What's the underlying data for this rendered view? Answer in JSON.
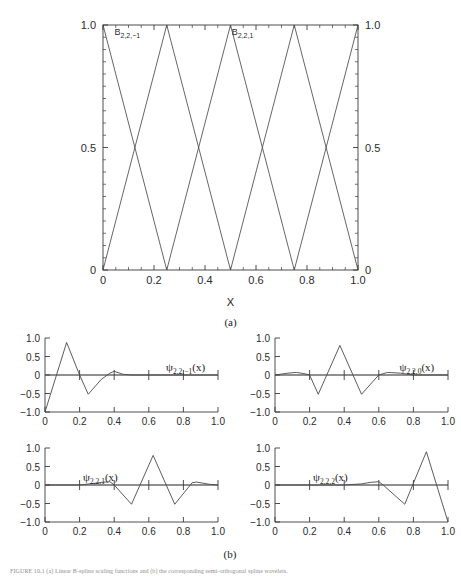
{
  "figure": {
    "panel_a_label": "(a)",
    "panel_b_label": "(b)",
    "caption": "FIGURE 10.1   (a) Linear B-spline scaling functions and (b) the corresponding semi-orthogonal spline wavelets."
  },
  "chart_data": [
    {
      "id": "panel-a",
      "type": "line",
      "title": "",
      "xlabel": "X",
      "ylabel": "",
      "xlim": [
        0,
        1
      ],
      "ylim": [
        0,
        1
      ],
      "grid": false,
      "xticks": [
        0,
        0.2,
        0.4,
        0.6,
        0.8,
        1.0
      ],
      "xticklabels": [
        "0",
        "0.2",
        "0.4",
        "0.6",
        "0.8",
        "1.0"
      ],
      "yticks": [
        0,
        0.5,
        1.0
      ],
      "yticklabels": [
        "0",
        "0.5",
        "1.0"
      ],
      "right_yticklabels": [
        "0",
        "0.5",
        "1.0"
      ],
      "annotations": [
        {
          "text": "B",
          "sub": "2,2,−1",
          "x": 0.045,
          "y": 0.975
        },
        {
          "text": "B",
          "sub": "2,2,1",
          "x": 0.505,
          "y": 0.975
        }
      ],
      "series": [
        {
          "name": "B_2,2,-1",
          "x": [
            0,
            0.25
          ],
          "values": [
            1,
            0
          ]
        },
        {
          "name": "B_2,2,0",
          "x": [
            0,
            0.25,
            0.5
          ],
          "values": [
            0,
            1,
            0
          ]
        },
        {
          "name": "B_2,2,1",
          "x": [
            0.25,
            0.5,
            0.75
          ],
          "values": [
            0,
            1,
            0
          ]
        },
        {
          "name": "B_2,2,2",
          "x": [
            0.5,
            0.75,
            1.0
          ],
          "values": [
            0,
            1,
            0
          ]
        },
        {
          "name": "B_2,2,3",
          "x": [
            0.75,
            1.0
          ],
          "values": [
            0,
            1
          ]
        }
      ]
    },
    {
      "id": "panel-b-1",
      "type": "line",
      "title": "ψ",
      "label_sub": "2,2,−1",
      "label_tail": "(x)",
      "xlim": [
        0,
        1
      ],
      "ylim": [
        -1,
        1
      ],
      "grid": false,
      "xticks": [
        0,
        0.2,
        0.4,
        0.6,
        0.8,
        1.0
      ],
      "xticklabels": [
        "0",
        "0.2",
        "0.4",
        "0.6",
        "0.8",
        "1.0"
      ],
      "yticks": [
        -1.0,
        -0.5,
        0,
        0.5,
        1.0
      ],
      "yticklabels": [
        "−1.0",
        "−0.5",
        "0",
        "0.5",
        "1.0"
      ],
      "x": [
        0,
        0.125,
        0.2,
        0.25,
        0.325,
        0.375,
        0.4,
        0.45,
        0.5,
        0.6,
        0.8,
        1.0
      ],
      "values": [
        -1.0,
        0.88,
        0.0,
        -0.52,
        -0.12,
        0.05,
        0.1,
        0.02,
        0.0,
        0.0,
        0.0,
        0.0
      ]
    },
    {
      "id": "panel-b-2",
      "type": "line",
      "title": "ψ",
      "label_sub": "2,2,0",
      "label_tail": "(x)",
      "xlim": [
        0,
        1
      ],
      "ylim": [
        -1,
        1
      ],
      "grid": false,
      "xticks": [
        0,
        0.2,
        0.4,
        0.6,
        0.8,
        1.0
      ],
      "xticklabels": [
        "0",
        "0.2",
        "0.4",
        "0.6",
        "0.8",
        "1.0"
      ],
      "yticks": [
        -1.0,
        -0.5,
        0,
        0.5,
        1.0
      ],
      "yticklabels": [
        "−1.0",
        "−0.5",
        "0",
        "0.5",
        "1.0"
      ],
      "x": [
        0,
        0.075,
        0.125,
        0.175,
        0.2,
        0.25,
        0.375,
        0.5,
        0.6,
        0.65,
        0.725,
        0.8,
        1.0
      ],
      "values": [
        0.0,
        0.05,
        0.07,
        0.03,
        0.0,
        -0.52,
        0.8,
        -0.52,
        0.0,
        0.07,
        0.05,
        0.0,
        0.0
      ]
    },
    {
      "id": "panel-b-3",
      "type": "line",
      "title": "ψ",
      "label_sub": "2,2,1",
      "label_tail": "(x)",
      "xlim": [
        0,
        1
      ],
      "ylim": [
        -1,
        1
      ],
      "grid": false,
      "xticks": [
        0,
        0.2,
        0.4,
        0.6,
        0.8,
        1.0
      ],
      "xticklabels": [
        "0",
        "0.2",
        "0.4",
        "0.6",
        "0.8",
        "1.0"
      ],
      "yticks": [
        -1.0,
        -0.5,
        0,
        0.5,
        1.0
      ],
      "yticklabels": [
        "−1.0",
        "−0.5",
        "0",
        "0.5",
        "1.0"
      ],
      "x": [
        0,
        0.2,
        0.275,
        0.325,
        0.375,
        0.4,
        0.5,
        0.625,
        0.75,
        0.85,
        0.875,
        0.95,
        1.0
      ],
      "values": [
        0.0,
        0.0,
        0.04,
        0.07,
        0.09,
        0.0,
        -0.52,
        0.8,
        -0.52,
        0.06,
        0.08,
        0.02,
        0.0
      ]
    },
    {
      "id": "panel-b-4",
      "type": "line",
      "title": "ψ",
      "label_sub": "2,2,2",
      "label_tail": "(x)",
      "xlim": [
        0,
        1
      ],
      "ylim": [
        -1,
        1
      ],
      "grid": false,
      "xticks": [
        0,
        0.2,
        0.4,
        0.6,
        0.8,
        1.0
      ],
      "xticklabels": [
        "0",
        "0.2",
        "0.4",
        "0.6",
        "0.8",
        "1.0"
      ],
      "yticks": [
        -1.0,
        -0.5,
        0,
        0.5,
        1.0
      ],
      "yticklabels": [
        "−1.0",
        "−0.5",
        "0",
        "0.5",
        "1.0"
      ],
      "x": [
        0,
        0.4,
        0.5,
        0.55,
        0.6,
        0.625,
        0.75,
        0.875,
        1.0
      ],
      "values": [
        0.0,
        0.0,
        0.03,
        0.07,
        0.09,
        0.0,
        -0.52,
        0.9,
        -1.0
      ]
    }
  ]
}
